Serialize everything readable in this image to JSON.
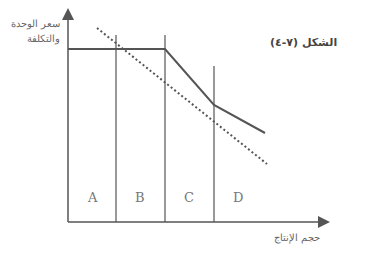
{
  "figure": {
    "title": "الشكل (٧-٤)",
    "y_axis_label_line1": "سعر الوحدة",
    "y_axis_label_line2": "والتكلفة",
    "x_axis_label": "حجم الإنتاج",
    "regions": [
      "A",
      "B",
      "C",
      "D"
    ]
  },
  "colors": {
    "axis": "#555555",
    "solid_line": "#555555",
    "dotted_line": "#555555",
    "text": "#666666"
  }
}
